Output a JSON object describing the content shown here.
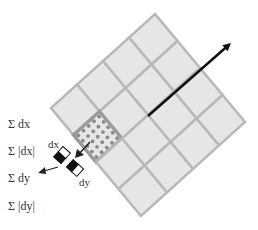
{
  "diagram": {
    "grid": {
      "rows": 4,
      "cols": 4,
      "top": [
        155,
        14
      ],
      "u": [
        22.5,
        27
      ],
      "v": [
        -26,
        23.5
      ],
      "fill": "#e6e6e6",
      "line_color": "#b8b8b8",
      "highlight_cell": {
        "col": 1,
        "row": 3,
        "sample_grid": 5,
        "dot_color": "#8a8a8a"
      }
    },
    "orientation_arrow": {
      "from": [
        148,
        116
      ],
      "to": [
        231,
        43
      ],
      "color": "#111111"
    },
    "haar": {
      "dx_label": "dx",
      "dy_label": "dy",
      "filter_dark": "#111111",
      "filter_light": "#ffffff"
    },
    "sums": [
      {
        "label": "Σ dx"
      },
      {
        "label": "Σ |dx|"
      },
      {
        "label": "Σ dy"
      },
      {
        "label": "Σ |dy|"
      }
    ]
  }
}
